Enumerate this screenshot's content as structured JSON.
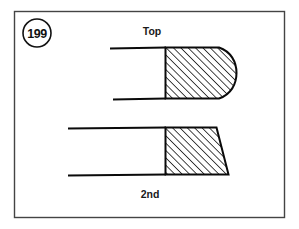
{
  "figure": {
    "number": "199",
    "border_color": "#444444",
    "ink_color": "#0a0a0a",
    "background_color": "#ffffff"
  },
  "labels": {
    "top_ring": "Top",
    "second_ring": "2nd"
  },
  "diagram_data": {
    "type": "technical-cross-section",
    "description": "Piston ring cross-section profiles",
    "items": [
      {
        "name": "top-ring",
        "label": "Top",
        "face_profile": "barrel",
        "label_position": "above"
      },
      {
        "name": "second-ring",
        "label": "2nd",
        "face_profile": "taper",
        "label_position": "below"
      }
    ],
    "hatch_angle_degrees": 45,
    "hatch_style": "section-lines"
  }
}
